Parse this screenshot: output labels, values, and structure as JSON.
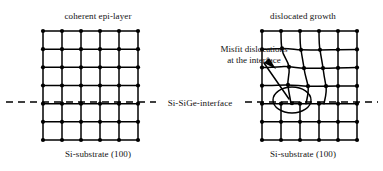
{
  "figure": {
    "type": "diagram",
    "background_color": "#ffffff",
    "ink_color": "#000000"
  },
  "labels": {
    "title_left": "coherent epi-layer",
    "title_right": "dislocated growth",
    "caption_left": "Si-substrate (100)",
    "caption_right": "Si-substrate (100)",
    "interface_label": "Si-SiGe-interface",
    "annotation_line1": "Misfit dislocations",
    "annotation_line2": "at the interface"
  },
  "panels": {
    "left": {
      "name": "coherent-lattice",
      "x": 43,
      "y": 31,
      "width": 95,
      "height": 109,
      "columns": 5,
      "rows": 6,
      "distorted": false
    },
    "right": {
      "name": "dislocated-lattice",
      "x": 262,
      "y": 31,
      "width": 95,
      "height": 109,
      "columns": 5,
      "rows": 6,
      "distorted": true,
      "dislocation_marker": {
        "shape": "ellipse",
        "cx": 292,
        "cy": 100,
        "rx": 19,
        "ry": 13
      }
    }
  },
  "interface": {
    "y": 102,
    "style": "dashed",
    "x_start": 6,
    "x_end": 378
  },
  "leader": {
    "from_x": 265,
    "from_y": 64,
    "to_x": 288,
    "to_y": 99
  }
}
